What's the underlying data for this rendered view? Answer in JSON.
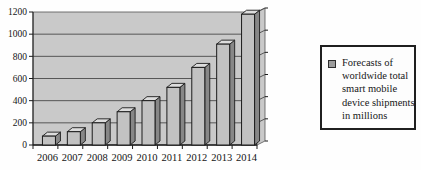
{
  "chart_data": {
    "type": "bar",
    "title": "",
    "xlabel": "",
    "ylabel": "",
    "categories": [
      "2006",
      "2007",
      "2008",
      "2009",
      "2010",
      "2011",
      "2012",
      "2013",
      "2014"
    ],
    "values": [
      80,
      120,
      200,
      300,
      400,
      520,
      700,
      910,
      1180
    ],
    "series_name": "Forecasts of worldwide total smart mobile device shipments in millions",
    "ylim": [
      0,
      1200
    ],
    "ytick_step": 200,
    "ytick_labels": [
      "0",
      "200",
      "400",
      "600",
      "800",
      "1000",
      "1200"
    ],
    "grid": true,
    "legend_position": "right",
    "style": "3d-grayscale"
  },
  "legend": {
    "lines": [
      "Forecasts of",
      "worldwide total",
      "smart mobile",
      "device shipments",
      "in millions"
    ]
  },
  "colors": {
    "page_bg": "#fefefe",
    "plot_bg": "#c9c9c9",
    "bar_front": "#c2c2c2",
    "bar_top": "#dddddd",
    "bar_side": "#878787",
    "gridline": "#4a4a4a",
    "axis": "#1c1c1c",
    "text": "#141414",
    "legend_border": "#1f1f1f",
    "swatch_fill": "#9d9d9d"
  }
}
